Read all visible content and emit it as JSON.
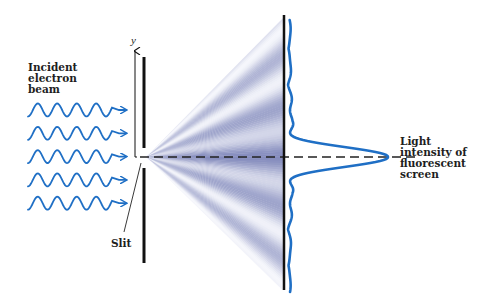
{
  "diagram": {
    "labels": {
      "incident_beam": "Incident\nelectron\nbeam",
      "slit": "Slit",
      "intensity": "Light\nintensity of\nfluorescent\nscreen",
      "y_axis": "y"
    },
    "colors": {
      "wave": "#1f6fc5",
      "curve": "#1f6fc5",
      "barrier": "#111111",
      "fringe_dark": "#7f86b8",
      "fringe_light": "#f4f5fb",
      "text": "#1e1e1e"
    },
    "beam_rows": 5,
    "fringes_per_side": 5
  }
}
